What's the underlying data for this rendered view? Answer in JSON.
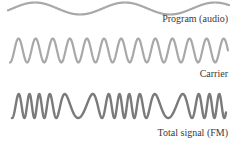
{
  "diagram": {
    "signals": [
      {
        "id": "program",
        "label": "Program (audio)",
        "label_top": 14,
        "color": "#a8a8a8",
        "stroke_width": 2.2,
        "center_y": 8.5,
        "amplitude": 6,
        "x_start": 8,
        "x_end": 229
      },
      {
        "id": "carrier",
        "label": "Carrier",
        "label_top": 69,
        "color": "#a8a8a8",
        "stroke_width": 2.2,
        "center_y": 50.5,
        "amplitude": 12,
        "x_start": 10,
        "x_end": 228,
        "cycles": 12.75
      },
      {
        "id": "fm",
        "label": "Total signal (FM)",
        "label_top": 128,
        "color": "#7a7a7a",
        "stroke_width": 2.4,
        "center_y": 106,
        "amplitude": 12,
        "x_start": 12,
        "x_end": 226
      }
    ]
  }
}
